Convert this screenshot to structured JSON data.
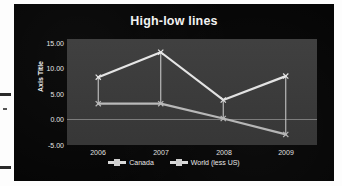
{
  "chart_data": {
    "type": "line",
    "title": "High-low lines",
    "xlabel": "",
    "ylabel": "Axis Title",
    "categories": [
      "2006",
      "2007",
      "2008",
      "2009"
    ],
    "yticks": [
      "15.00",
      "10.00",
      "5.00",
      "0.00",
      "-5.00"
    ],
    "ytick_values": [
      15,
      10,
      5,
      0,
      -5
    ],
    "ylim": [
      -5,
      15
    ],
    "grid": false,
    "legend_position": "bottom",
    "series": [
      {
        "name": "Canada",
        "values": [
          2.8,
          2.8,
          0.0,
          -3.0
        ],
        "color": "#bfbfbf"
      },
      {
        "name": "World (less US)",
        "values": [
          7.8,
          12.5,
          3.5,
          8.0
        ],
        "color": "#e8e8e8"
      }
    ],
    "highlow_connectors": true
  },
  "legend": {
    "items": [
      {
        "label": "Canada"
      },
      {
        "label": "World (less US)"
      }
    ]
  },
  "colors": {
    "figure_background": "#050505",
    "plot_background": "#3a3a3a",
    "text": "#e8e8e8",
    "zero_line": "#9a9a9a"
  }
}
